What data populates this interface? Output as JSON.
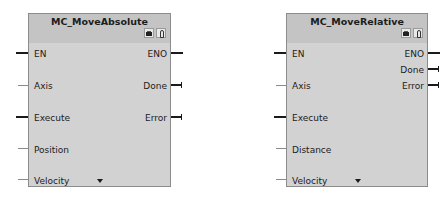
{
  "blocks": [
    {
      "title": "MC_MoveAbsolute",
      "inputs": [
        "EN",
        "Axis",
        "Execute",
        "Position",
        "Velocity"
      ],
      "outputs": [
        "ENO",
        "Done",
        "Error"
      ],
      "icons": [
        "instance-db-icon",
        "diagnostics-icon"
      ]
    },
    {
      "title": "MC_MoveRelative",
      "inputs": [
        "EN",
        "Axis",
        "Execute",
        "Distance",
        "Velocity"
      ],
      "outputs": [
        "ENO",
        "Done",
        "Error"
      ],
      "icons": [
        "instance-db-icon",
        "diagnostics-icon"
      ]
    }
  ]
}
